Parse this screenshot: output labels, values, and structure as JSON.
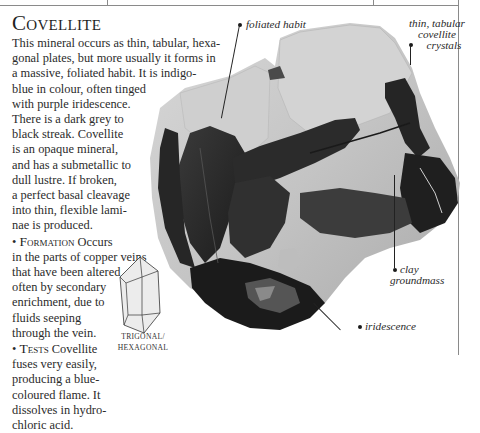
{
  "page": {
    "title": "Covellite",
    "body_lines": [
      "This mineral occurs as thin, tabular, hexa-",
      "gonal plates, but more usually it forms in",
      "a massive, foliated habit. It is indigo-",
      "blue in colour, often tinged",
      "with purple iridescence.",
      "There is a dark grey to",
      "black streak. Covellite",
      "is an opaque mineral,",
      "and has a submetallic to",
      "dull lustre. If broken,",
      "a perfect basal cleavage",
      "into thin, flexible lami-",
      "nae is produced."
    ],
    "formation": {
      "bullet": "•",
      "heading": "Formation",
      "lines": [
        " Occurs",
        "in the parts of copper veins",
        "that have been altered –",
        "often by secondary",
        "enrichment, due to",
        "fluids seeping",
        "through the vein."
      ]
    },
    "tests": {
      "bullet": "•",
      "heading": "Tests",
      "lines": [
        " Covellite",
        "fuses very easily,",
        "producing a blue-",
        "coloured flame. It",
        "dissolves in hydro-",
        "chloric acid."
      ]
    },
    "crystal_system": {
      "icon": "trigonal-hexagonal-crystal-icon",
      "line1": "TRIGONAL/",
      "line2": "HEXAGONAL"
    },
    "annotations": {
      "foliated_habit": "foliated habit",
      "thin_tabular_1": "thin, tabular",
      "thin_tabular_2": "covellite",
      "thin_tabular_3": "crystals",
      "clay_1": "clay",
      "clay_2": "groundmass",
      "iridescence": "iridescence"
    },
    "colors": {
      "text": "#2b2b2b",
      "rule": "#8a8a8a",
      "rock_light": "#c9c9c9",
      "covellite_dark": "#2a2a2a"
    }
  }
}
